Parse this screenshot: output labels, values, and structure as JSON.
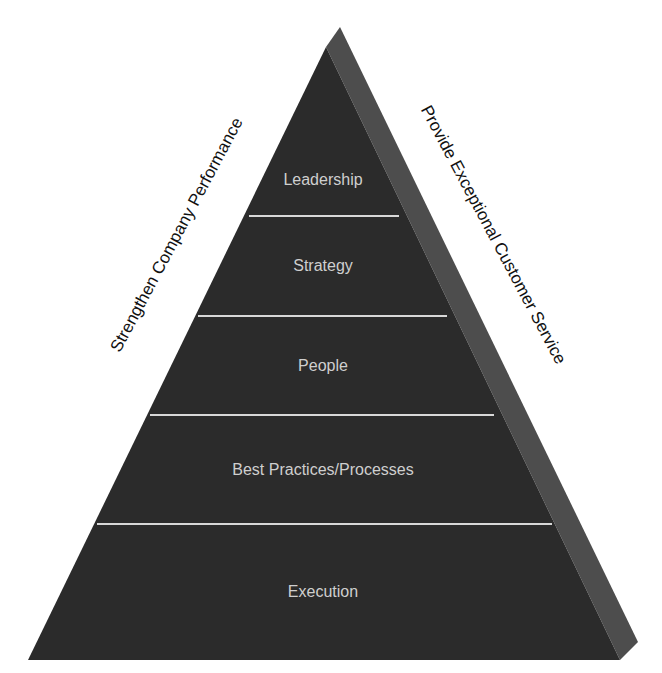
{
  "diagram": {
    "type": "pyramid",
    "tiers": [
      {
        "label": "Leadership",
        "center_y": 180
      },
      {
        "label": "Strategy",
        "center_y": 266
      },
      {
        "label": "People",
        "center_y": 366
      },
      {
        "label": "Best Practices/Processes",
        "center_y": 470
      },
      {
        "label": "Execution",
        "center_y": 592
      }
    ],
    "left_side_label": "Strengthen Company Performance",
    "right_side_label": "Provide Exceptional Customer Service",
    "colors": {
      "front_face": "#2b2b2b",
      "side_face": "#4d4d4d",
      "divider": "#d8d8d8",
      "tier_text": "#cfcfcf",
      "side_text": "#111111"
    }
  }
}
